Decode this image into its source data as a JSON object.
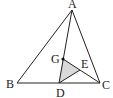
{
  "diagram": {
    "type": "geometry",
    "points": {
      "A": {
        "label": "A",
        "x": 72,
        "y": 10
      },
      "B": {
        "label": "B",
        "x": 17,
        "y": 83
      },
      "C": {
        "label": "C",
        "x": 100,
        "y": 83
      },
      "D": {
        "label": "D",
        "x": 59,
        "y": 83
      },
      "G": {
        "label": "G",
        "x": 63,
        "y": 59
      },
      "E": {
        "label": "E",
        "x": 80,
        "y": 70
      }
    },
    "segments": [
      "AB",
      "BC",
      "CA",
      "AD",
      "GC",
      "DE"
    ],
    "shaded_region": [
      "G",
      "D",
      "E"
    ],
    "shade_color": "#d9d9d9",
    "line_color": "#222222"
  }
}
